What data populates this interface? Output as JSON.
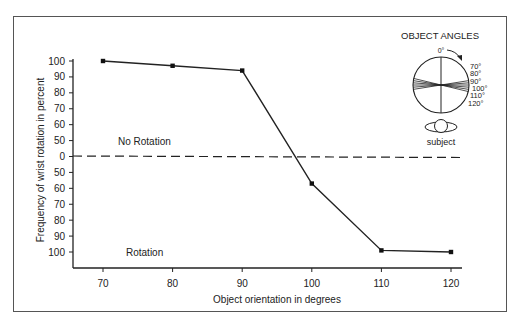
{
  "chart_data": {
    "type": "line",
    "title": "",
    "xlabel": "Object orientation in degrees",
    "ylabel": "Frequency of wrist rotation in percent",
    "x": [
      70,
      80,
      90,
      100,
      110,
      120
    ],
    "series": [
      {
        "name": "Frequency of wrist rotation",
        "values": [
          100,
          97,
          94,
          -57,
          -99,
          -100
        ],
        "note": "positive = No Rotation (upper half), negative = Rotation (lower half, magnitude shown on axis)"
      }
    ],
    "y_tick_labels": [
      "100",
      "90",
      "80",
      "70",
      "60",
      "50",
      "0",
      "50",
      "60",
      "70",
      "80",
      "90",
      "100"
    ],
    "x_tick_labels": [
      "70",
      "80",
      "90",
      "100",
      "110",
      "120"
    ],
    "region_labels": {
      "upper": "No Rotation",
      "lower": "Rotation"
    },
    "reference_line": {
      "y": 0,
      "style": "dashed"
    },
    "grid": false,
    "legend": null
  },
  "inset": {
    "title": "OBJECT ANGLES",
    "top_label": "0°",
    "angle_labels": [
      "70°",
      "80°",
      "90°",
      "100°",
      "110°",
      "120°"
    ],
    "subject_label": "subject"
  }
}
